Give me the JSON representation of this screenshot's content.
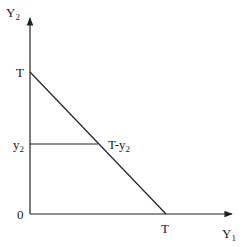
{
  "diagram": {
    "axes": {
      "y_label": {
        "main": "Y",
        "sub": "2"
      },
      "x_label": {
        "main": "Y",
        "sub": "1"
      },
      "origin_label": "0"
    },
    "y_ticks": {
      "top": "T",
      "mid": {
        "main": "y",
        "sub": "2"
      }
    },
    "x_ticks": {
      "right": "T"
    },
    "annotations": {
      "intersection": {
        "main": "T-y",
        "sub": "2"
      }
    },
    "line_color": "#222222"
  }
}
